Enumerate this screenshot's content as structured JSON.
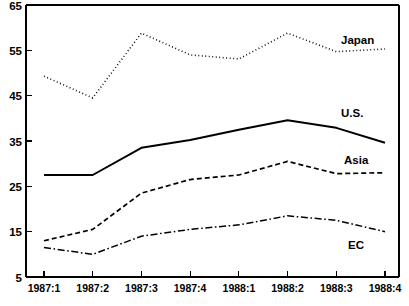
{
  "chart_data": {
    "type": "line",
    "title": "",
    "subtitle": "",
    "xlabel": "",
    "ylabel": "",
    "categories": [
      "1987:1",
      "1987:2",
      "1987:3",
      "1987:4",
      "1988:1",
      "1988:2",
      "1988:3",
      "1988:4"
    ],
    "ylim": [
      5,
      65
    ],
    "yticks": [
      5,
      15,
      25,
      35,
      45,
      55,
      65
    ],
    "ytick_labels": [
      "5",
      "15",
      "25",
      "35",
      "45",
      "55",
      "65"
    ],
    "grid": false,
    "legend_position": "inline-right-of-series",
    "series": [
      {
        "name": "Japan",
        "label": "Japan",
        "style": "dotted",
        "color": "#000000",
        "values": [
          49.3,
          44.5,
          58.8,
          54.0,
          53.1,
          58.8,
          54.7,
          55.3
        ],
        "label_x": "1988:3",
        "label_value": 57.5
      },
      {
        "name": "U.S.",
        "label": "U.S.",
        "style": "solid",
        "color": "#000000",
        "values": [
          27.5,
          27.5,
          33.5,
          35.2,
          37.5,
          39.6,
          37.9,
          34.6
        ],
        "label_x": "1988:3",
        "label_value": 40.5
      },
      {
        "name": "Asia",
        "label": "Asia",
        "style": "dashed",
        "color": "#000000",
        "values": [
          13.0,
          15.5,
          23.5,
          26.5,
          27.5,
          30.5,
          27.8,
          28.0
        ],
        "label_x": "1988:3",
        "label_value": 31.0
      },
      {
        "name": "EC",
        "label": "EC",
        "style": "dash-dot",
        "color": "#000000",
        "values": [
          11.5,
          10.0,
          14.0,
          15.5,
          16.5,
          18.5,
          17.5,
          15.0
        ],
        "label_x": "1988:3",
        "label_value": 13.0
      }
    ]
  },
  "axes": {
    "y_tick_labels": [
      "65",
      "55",
      "45",
      "35",
      "25",
      "15",
      "5"
    ],
    "x_tick_labels": [
      "1987:1",
      "1987:2",
      "1987:3",
      "1987:4",
      "1988:1",
      "1988:2",
      "1988:3",
      "1988:4"
    ]
  },
  "series_labels": {
    "japan": "Japan",
    "us": "U.S.",
    "asia": "Asia",
    "ec": "EC"
  },
  "colors": {
    "axis": "#000000",
    "plot_background": "#ffffff",
    "series": "#000000"
  }
}
